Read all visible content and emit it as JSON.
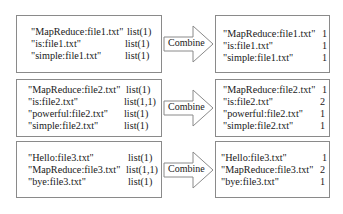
{
  "groups": [
    {
      "input": {
        "rows": [
          {
            "key": "\"MapReduce:file1.txt\"",
            "value": "list(1)"
          },
          {
            "key": "\"is:file1.txt\"",
            "value": "list(1)"
          },
          {
            "key": "\"simple:file1.txt\"",
            "value": "list(1)"
          }
        ]
      },
      "operation": "Combine",
      "output": {
        "rows": [
          {
            "key": "\"MapReduce:file1.txt\"",
            "value": "1"
          },
          {
            "key": "\"is:file1.txt\"",
            "value": "1"
          },
          {
            "key": "\"simple:file1.txt\"",
            "value": "1"
          }
        ]
      }
    },
    {
      "input": {
        "rows": [
          {
            "key": "\"MapReduce:file2.txt\"",
            "value": "list(1)"
          },
          {
            "key": "\"is:file2.txt\"",
            "value": "list(1,1)"
          },
          {
            "key": "\"powerful:file2.txt\"",
            "value": "list(1)"
          },
          {
            "key": "\"simple:file2.txt\"",
            "value": "list(1)"
          }
        ]
      },
      "operation": "Combine",
      "output": {
        "rows": [
          {
            "key": "\"MapReduce:file2.txt\"",
            "value": "1"
          },
          {
            "key": "\"is:file2.txt\"",
            "value": "2"
          },
          {
            "key": "\"powerful:file2.txt\"",
            "value": "1"
          },
          {
            "key": "\"simple:file2.txt\"",
            "value": "1"
          }
        ]
      }
    },
    {
      "input": {
        "rows": [
          {
            "key": "\"Hello:file3.txt\"",
            "value": "list(1)"
          },
          {
            "key": "\"MapReduce:file3.txt\"",
            "value": "list(1,1)"
          },
          {
            "key": "\"bye:file3.txt\"",
            "value": "list(1)"
          }
        ]
      },
      "operation": "Combine",
      "output": {
        "rows": [
          {
            "key": "\"Hello:file3.txt\"",
            "value": "1"
          },
          {
            "key": "\"MapReduce:file3.txt\"",
            "value": "2"
          },
          {
            "key": "\"bye:file3.txt\"",
            "value": "1"
          }
        ]
      }
    }
  ],
  "colors": {
    "border": "#8a8a8a",
    "text": "#1a1a1a",
    "background": "#ffffff"
  }
}
